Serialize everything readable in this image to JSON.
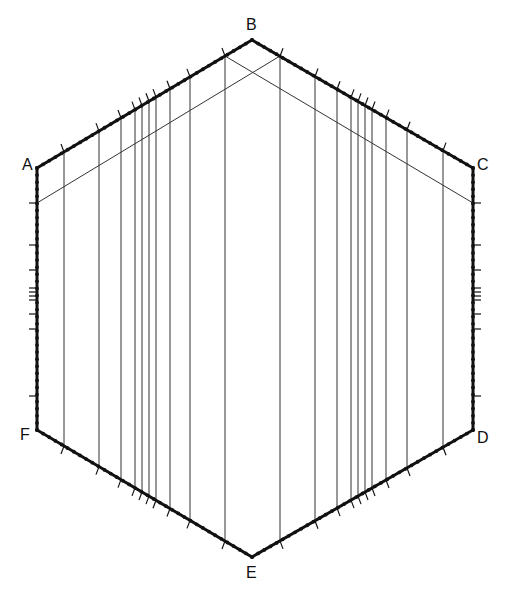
{
  "diagram": {
    "type": "hexagon-construction",
    "stroke_color": "#111111",
    "thin_line_color": "#333333",
    "vertices": [
      {
        "label": "A",
        "x": 37,
        "y": 168,
        "lx": 22,
        "ly": 157
      },
      {
        "label": "B",
        "x": 252,
        "y": 40,
        "lx": 246,
        "ly": 17
      },
      {
        "label": "C",
        "x": 473,
        "y": 168,
        "lx": 477,
        "ly": 157
      },
      {
        "label": "D",
        "x": 473,
        "y": 430,
        "lx": 477,
        "ly": 430
      },
      {
        "label": "E",
        "x": 252,
        "y": 557,
        "lx": 246,
        "ly": 565
      },
      {
        "label": "F",
        "x": 37,
        "y": 430,
        "lx": 20,
        "ly": 427
      }
    ],
    "vertical_lines_x": [
      64,
      99,
      121,
      135,
      142,
      149,
      156,
      170,
      190,
      225,
      280,
      315,
      337,
      351,
      358,
      365,
      372,
      386,
      407,
      443
    ],
    "side_ticks_y": [
      203,
      245,
      270,
      288,
      292,
      296,
      300,
      314,
      329,
      396
    ],
    "diagonals": [
      {
        "x1": 225,
        "y1": 56,
        "x2": 473,
        "y2": 203
      },
      {
        "x1": 280,
        "y1": 56,
        "x2": 37,
        "y2": 203
      }
    ]
  }
}
